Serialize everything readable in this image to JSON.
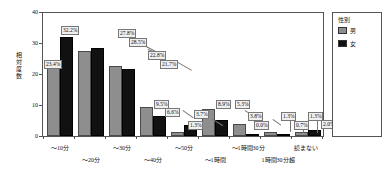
{
  "chart_data": {
    "type": "bar",
    "title": "",
    "xlabel": "",
    "ylabel": "相対度数",
    "ylim": [
      0,
      40
    ],
    "yticks": [
      "0",
      "10",
      "20",
      "30",
      "40"
    ],
    "grid": false,
    "legend_position": "right",
    "legend_title": "性別",
    "categories": [
      "～10分",
      "～20分",
      "～30分",
      "～40分",
      "～50分",
      "～1時間",
      "～1時間30分",
      "1時間30分超",
      "読まない"
    ],
    "categories_plotted": [
      "～10分",
      "～20分",
      "～30分",
      "～40分",
      "～50分",
      "～1時間",
      "～1時間30分",
      "1時間30分超",
      "読まない"
    ],
    "series": [
      {
        "name": "男",
        "color": "#8e8e8e",
        "values": [
          23.4,
          27.8,
          22.8,
          9.5,
          1.3,
          8.9,
          3.8,
          1.3,
          1.3
        ],
        "labels": [
          "23.4%",
          "27.8%",
          "22.8%",
          "9.5%",
          "1.3%",
          "8.9%",
          "3.8%",
          "1.3%",
          "1.3%"
        ]
      },
      {
        "name": "女",
        "color": "#111111",
        "values": [
          32.2,
          28.5,
          21.7,
          6.6,
          3.7,
          5.3,
          0.0,
          0.7,
          2.0
        ],
        "labels": [
          "32.2%",
          "28.5%",
          "21.7%",
          "6.6%",
          "3.7%",
          "5.3%",
          "0.0%",
          "0.7%",
          "2.0%"
        ]
      }
    ]
  },
  "axis": {
    "y_label": "相対度数",
    "y_ticks": [
      "40",
      "30",
      "20",
      "10",
      "0"
    ],
    "x_labels_row1": [
      "～10分",
      "～30分",
      "～50分",
      "～1時間30分",
      "読まない"
    ],
    "x_labels_row2": [
      "～20分",
      "～40分",
      "～1時間",
      "1時間30分超"
    ]
  },
  "legend": {
    "title": "性別",
    "items": [
      {
        "label": "男",
        "color": "#8e8e8e"
      },
      {
        "label": "女",
        "color": "#111111"
      }
    ]
  },
  "data_labels": {
    "g1m": "23.4%",
    "g1f": "32.2%",
    "g2m": "27.8%",
    "g2f": "28.5%",
    "g3m": "22.8%",
    "g3f": "21.7%",
    "g4m": "9.5%",
    "g4f": "6.6%",
    "g5m": "1.3%",
    "g5f": "3.7%",
    "g6m": "8.9%",
    "g6f": "5.3%",
    "g7m": "3.8%",
    "g7f": "0.0%",
    "g8m": "1.3%",
    "g8f": "0.7%",
    "g9m": "1.3%",
    "g9f": "2.0%"
  }
}
